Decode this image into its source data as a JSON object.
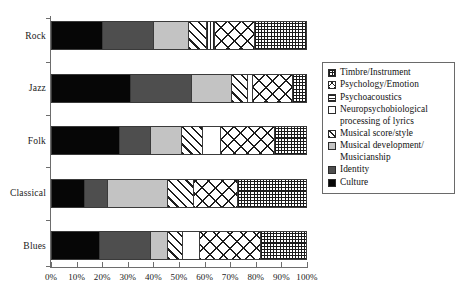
{
  "chart_data": {
    "type": "bar",
    "orientation": "horizontal",
    "stacked": true,
    "normalized": true,
    "title": "",
    "subtitle": "",
    "xlabel": "",
    "ylabel": "",
    "xlim": [
      0,
      100
    ],
    "grid": false,
    "legend_position": "right",
    "x_tick_labels": [
      "0%",
      "10%",
      "20%",
      "30%",
      "40%",
      "50%",
      "60%",
      "70%",
      "80%",
      "90%",
      "100%"
    ],
    "x_tick_values": [
      0,
      10,
      20,
      30,
      40,
      50,
      60,
      70,
      80,
      90,
      100
    ],
    "categories": [
      "Rock",
      "Jazz",
      "Folk",
      "Classical",
      "Blues"
    ],
    "series": [
      {
        "name": "Culture",
        "pattern": "solid-black",
        "color": "#060606",
        "values": [
          20,
          31,
          27,
          13,
          19
        ]
      },
      {
        "name": "Identity",
        "pattern": "solid-dark-gray",
        "color": "#4e4e4e",
        "values": [
          20,
          24,
          12.5,
          9,
          20
        ]
      },
      {
        "name": "Musical development/ Musicianship",
        "pattern": "solid-light-gray",
        "color": "#c3c3c3",
        "values": [
          14,
          16,
          12,
          24,
          7
        ]
      },
      {
        "name": "Musical score/style",
        "pattern": "diagonal-hatch",
        "color": "#ffffff",
        "values": [
          7,
          6,
          8.5,
          10,
          6
        ]
      },
      {
        "name": "Neuropsychobiological processing of lyrics",
        "pattern": "blank-white",
        "color": "#ffffff",
        "values": [
          0,
          2,
          7,
          0,
          6.5
        ]
      },
      {
        "name": "Psychoacoustics",
        "pattern": "fine-lines",
        "color": "#ffffff",
        "values": [
          3,
          0,
          0,
          0,
          0
        ]
      },
      {
        "name": "Psychology/Emotion",
        "pattern": "cross-hatch",
        "color": "#ffffff",
        "values": [
          16,
          16,
          21.5,
          17.5,
          24
        ]
      },
      {
        "name": "Timbre/Instrument",
        "pattern": "fine-grid",
        "color": "#ffffff",
        "values": [
          20,
          5,
          12.5,
          27,
          18
        ]
      }
    ]
  },
  "legend": {
    "items": [
      {
        "label": "Timbre/Instrument",
        "swatch": "fine-grid-icon"
      },
      {
        "label": "Psychology/Emotion",
        "swatch": "cross-hatch-icon"
      },
      {
        "label": "Psychoacoustics",
        "swatch": "fine-lines-icon"
      },
      {
        "label": "Neuropsychobiological processing of lyrics",
        "swatch": "blank-white-icon"
      },
      {
        "label": "Musical score/style",
        "swatch": "diagonal-hatch-icon"
      },
      {
        "label": "Musical development/ Musicianship",
        "swatch": "solid-light-gray-icon"
      },
      {
        "label": "Identity",
        "swatch": "solid-dark-gray-icon"
      },
      {
        "label": "Culture",
        "swatch": "solid-black-icon"
      }
    ]
  },
  "axis_colors": {
    "axis_line": "#6d6d6d",
    "bar_outline": "#3a3a3a",
    "legend_border": "#6a6a6a",
    "text": "#1a1a1a"
  }
}
